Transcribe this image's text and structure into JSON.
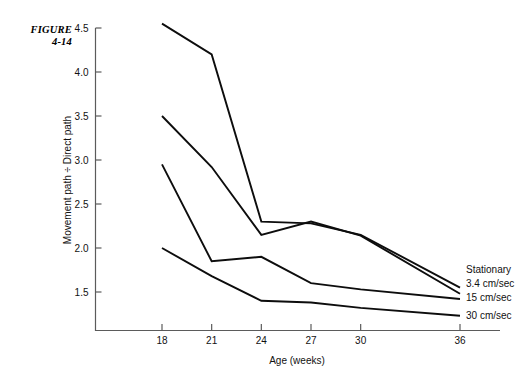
{
  "figure": {
    "label_line1": "FIGURE",
    "label_line2": "4-14"
  },
  "chart_data": {
    "type": "line",
    "title": "",
    "xlabel": "Age (weeks)",
    "ylabel": "Movement path ÷ Direct path",
    "x": [
      18,
      21,
      24,
      27,
      30,
      36
    ],
    "x_tick_labels": [
      "18",
      "21",
      "24",
      "27",
      "30",
      "36"
    ],
    "y_tick_labels": [
      "4.5",
      "4.0",
      "3.5",
      "3.0",
      "2.5",
      "2.0",
      "1.5"
    ],
    "y_ticks": [
      4.5,
      4.0,
      3.5,
      3.0,
      2.5,
      2.0,
      1.5
    ],
    "ylim": [
      1.15,
      4.62
    ],
    "xlim": [
      16.2,
      37.4
    ],
    "grid": false,
    "legend_position": "right-end-of-lines",
    "series": [
      {
        "name": "Stationary",
        "legend_label": "Stationary",
        "values": [
          4.55,
          4.2,
          2.3,
          2.28,
          2.15,
          1.55
        ]
      },
      {
        "name": "3.4 cm/sec",
        "legend_label": "3.4 cm/sec",
        "values": [
          3.5,
          2.92,
          2.15,
          2.3,
          2.14,
          1.48
        ]
      },
      {
        "name": "15 cm/sec",
        "legend_label": "15 cm/sec",
        "values": [
          2.95,
          1.85,
          1.9,
          1.6,
          1.53,
          1.42
        ]
      },
      {
        "name": "30 cm/sec",
        "legend_label": "30 cm/sec",
        "values": [
          2.0,
          1.68,
          1.4,
          1.38,
          1.32,
          1.23
        ]
      }
    ]
  }
}
